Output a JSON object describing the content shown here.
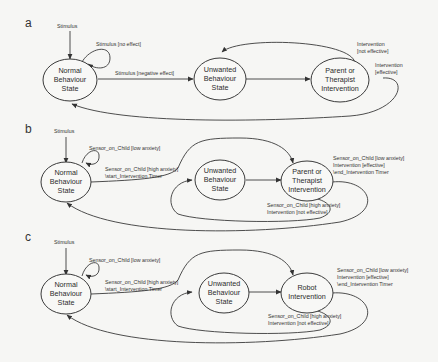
{
  "figure": {
    "panels": [
      {
        "label": "a",
        "states": [
          {
            "id": "normal",
            "lines": [
              "Normal",
              "Behaviour",
              "State"
            ]
          },
          {
            "id": "unwanted",
            "lines": [
              "Unwanted",
              "Behaviour",
              "State"
            ]
          },
          {
            "id": "intervention",
            "lines": [
              "Parent or",
              "Therapist",
              "Intervention"
            ]
          }
        ],
        "transitions": {
          "entry": [
            "Stimulus"
          ],
          "self_loop": [
            "Stimulus [no effect]"
          ],
          "normal_to_unwanted": [
            "Stimulus [negative effect]"
          ],
          "intervention_to_unwanted": [
            "Intervention",
            "[not effective]"
          ],
          "intervention_to_normal": [
            "Intervention",
            "[effective]"
          ]
        }
      },
      {
        "label": "b",
        "states": [
          {
            "id": "normal",
            "lines": [
              "Normal",
              "Behaviour",
              "State"
            ]
          },
          {
            "id": "unwanted",
            "lines": [
              "Unwanted",
              "Behaviour",
              "State"
            ]
          },
          {
            "id": "intervention",
            "lines": [
              "Parent or",
              "Therapist",
              "Intervention"
            ]
          }
        ],
        "transitions": {
          "entry": [
            "Stimulus"
          ],
          "self_loop": [
            "Sensor_on_Child [low anxiety]"
          ],
          "normal_to_intervention": [
            "Sensor_on_Child [high anxiety]",
            "\\start_Intervention Timer"
          ],
          "intervention_to_unwanted": [
            "Sensor_on_Child [high anxiety]",
            "Intervention [not effective]"
          ],
          "intervention_to_normal": [
            "Sensor_on_Child [low anxiety]",
            "Intervention [effective]",
            "\\end_Intervention Timer"
          ]
        }
      },
      {
        "label": "c",
        "states": [
          {
            "id": "normal",
            "lines": [
              "Normal",
              "Behaviour",
              "State"
            ]
          },
          {
            "id": "unwanted",
            "lines": [
              "Unwanted",
              "Behaviour",
              "State"
            ]
          },
          {
            "id": "intervention",
            "lines": [
              "Robot",
              "Intervention"
            ]
          }
        ],
        "transitions": {
          "entry": [
            "Stimulus"
          ],
          "self_loop": [
            "Sensor_on_Child [low anxiety]"
          ],
          "normal_to_intervention": [
            "Sensor_on_Child [high anxiety]",
            "\\start_Intervention Timer"
          ],
          "intervention_to_unwanted": [
            "Sensor_on_Child [high anxiety]",
            "Intervention [not effective]"
          ],
          "intervention_to_normal": [
            "Sensor_on_Child [low anxiety]",
            "Intervention [effective]",
            "\\end_Intervention Timer"
          ]
        }
      }
    ]
  }
}
